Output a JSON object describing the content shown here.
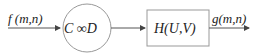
{
  "diagram": {
    "input_label": "f (m,n)",
    "circle_label": "C ∞D",
    "box_label": "H(U,V)",
    "output_label": "g(m,n)",
    "colors": {
      "stroke": "#888888",
      "text": "#222222"
    }
  }
}
